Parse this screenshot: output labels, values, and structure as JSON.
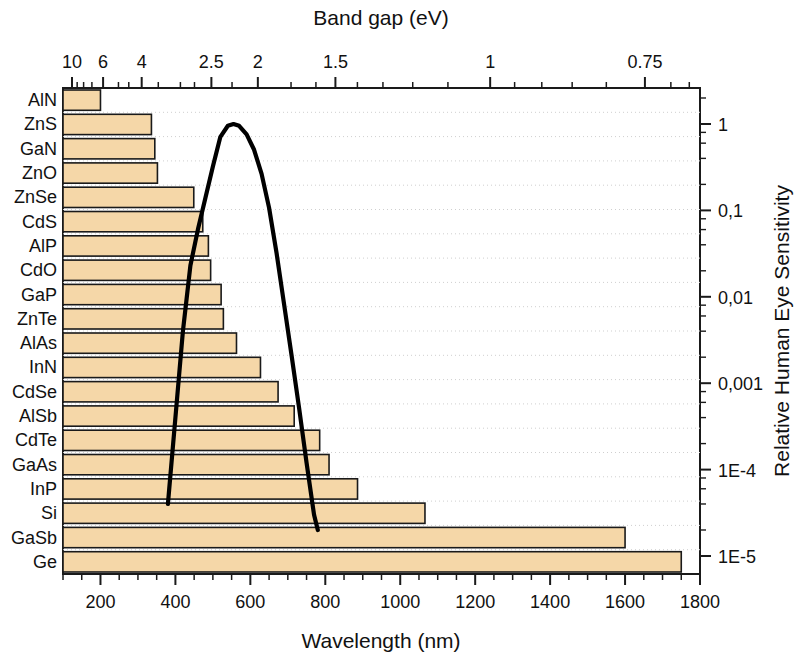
{
  "figure": {
    "top_axis_title": "Band gap (eV)",
    "bottom_axis_title": "Wavelength (nm)",
    "right_axis_title": "Relative Human Eye Sensitivity"
  },
  "chart_data": {
    "type": "bar",
    "title": "",
    "xlabel": "Wavelength (nm)",
    "ylabel": "",
    "xlim": [
      100,
      1800
    ],
    "grid": true,
    "orientation": "horizontal",
    "bar_color": "#F5D7A8",
    "bar_edge_color": "#1a1a1a",
    "categories": [
      "AlN",
      "ZnS",
      "GaN",
      "ZnO",
      "ZnSe",
      "CdS",
      "AlP",
      "CdO",
      "GaP",
      "ZnTe",
      "AlAs",
      "InN",
      "CdSe",
      "AlSb",
      "CdTe",
      "GaAs",
      "InP",
      "Si",
      "GaSb",
      "Ge"
    ],
    "values": [
      200,
      336,
      345,
      352,
      449,
      473,
      488,
      494,
      522,
      528,
      563,
      627,
      674,
      717,
      785,
      810,
      886,
      1066,
      1600,
      1750
    ],
    "value_unit": "nm",
    "top_axis": {
      "label": "Band gap (eV)",
      "tick_labels": [
        "10",
        "6",
        "4",
        "2.5",
        "2",
        "1.5",
        "1",
        "0.75"
      ],
      "tick_values_ev": [
        10,
        6,
        4,
        2.5,
        2,
        1.5,
        1,
        0.75
      ],
      "tick_wavelengths_nm": [
        124,
        207,
        310,
        496,
        620,
        827,
        1240,
        1653
      ]
    },
    "bottom_axis": {
      "label": "Wavelength (nm)",
      "tick_labels": [
        "200",
        "400",
        "600",
        "800",
        "1000",
        "1200",
        "1400",
        "1600",
        "1800"
      ],
      "tick_values": [
        200,
        400,
        600,
        800,
        1000,
        1200,
        1400,
        1600,
        1800
      ]
    },
    "right_axis": {
      "label": "Relative Human Eye Sensitivity",
      "scale": "log",
      "tick_labels": [
        "1",
        "0,1",
        "0,01",
        "0,001",
        "1E-4",
        "1E-5"
      ],
      "tick_values": [
        1,
        0.1,
        0.01,
        0.001,
        0.0001,
        1e-05
      ]
    },
    "series": [
      {
        "name": "Relative Human Eye Sensitivity",
        "type": "line",
        "color": "#000000",
        "axis": "right",
        "x": [
          380,
          400,
          420,
          440,
          460,
          480,
          500,
          520,
          540,
          555,
          570,
          590,
          610,
          630,
          650,
          670,
          690,
          710,
          730,
          750,
          770,
          780
        ],
        "y": [
          4e-05,
          0.0004,
          0.004,
          0.023,
          0.06,
          0.139,
          0.323,
          0.71,
          0.954,
          1.0,
          0.952,
          0.757,
          0.503,
          0.265,
          0.107,
          0.032,
          0.0082,
          0.0021,
          0.00052,
          0.00012,
          3e-05,
          2e-05
        ]
      }
    ]
  }
}
